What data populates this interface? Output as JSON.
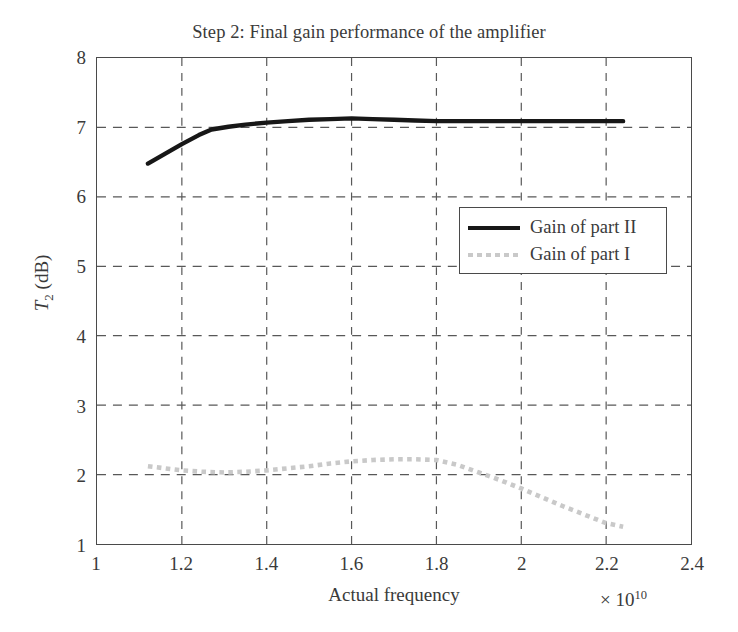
{
  "chart_data": {
    "type": "line",
    "title": "Step 2: Final gain performance of the amplifier",
    "xlabel": "Actual frequency",
    "ylabel": "T_2 (dB)",
    "ylabel_base": "T",
    "ylabel_sub": "2",
    "ylabel_unit": " (dB)",
    "x_multiplier_text": "× 10",
    "x_multiplier_exp": "10",
    "xlim": [
      1,
      2.4
    ],
    "ylim": [
      1,
      8
    ],
    "xticks": [
      "1",
      "1.2",
      "1.4",
      "1.6",
      "1.8",
      "2",
      "2.2",
      "2.4"
    ],
    "xtick_values": [
      1,
      1.2,
      1.4,
      1.6,
      1.8,
      2,
      2.2,
      2.4
    ],
    "yticks": [
      "1",
      "2",
      "3",
      "4",
      "5",
      "6",
      "7",
      "8"
    ],
    "ytick_values": [
      1,
      2,
      3,
      4,
      5,
      6,
      7,
      8
    ],
    "grid": true,
    "grid_style": "dashed",
    "grid_color": "#585858",
    "legend_position": "center-right",
    "series": [
      {
        "name": "Gain of part II",
        "style": "solid",
        "color": "#171717",
        "width": 4.4,
        "x": [
          1.12,
          1.16,
          1.2,
          1.24,
          1.27,
          1.31,
          1.35,
          1.4,
          1.45,
          1.5,
          1.55,
          1.6,
          1.65,
          1.7,
          1.75,
          1.8,
          1.85,
          1.9,
          1.95,
          2.0,
          2.05,
          2.1,
          2.15,
          2.2,
          2.24
        ],
        "y": [
          6.48,
          6.62,
          6.76,
          6.89,
          6.97,
          7.01,
          7.04,
          7.07,
          7.09,
          7.11,
          7.12,
          7.13,
          7.12,
          7.11,
          7.1,
          7.09,
          7.09,
          7.09,
          7.09,
          7.09,
          7.09,
          7.09,
          7.09,
          7.09,
          7.09
        ]
      },
      {
        "name": "Gain of part I",
        "style": "dotted",
        "color": "#c9c9c9",
        "width": 4.6,
        "x": [
          1.12,
          1.16,
          1.2,
          1.25,
          1.3,
          1.35,
          1.4,
          1.45,
          1.5,
          1.55,
          1.6,
          1.65,
          1.7,
          1.75,
          1.8,
          1.85,
          1.9,
          1.95,
          2.0,
          2.05,
          2.1,
          2.15,
          2.2,
          2.24
        ],
        "y": [
          2.12,
          2.09,
          2.06,
          2.04,
          2.03,
          2.04,
          2.06,
          2.09,
          2.12,
          2.16,
          2.19,
          2.21,
          2.22,
          2.22,
          2.21,
          2.14,
          2.03,
          1.92,
          1.8,
          1.67,
          1.54,
          1.42,
          1.3,
          1.25
        ]
      }
    ]
  },
  "legend": {
    "items": [
      {
        "label": "Gain of part II",
        "style": "solid"
      },
      {
        "label": "Gain of part I",
        "style": "dotted"
      }
    ]
  }
}
